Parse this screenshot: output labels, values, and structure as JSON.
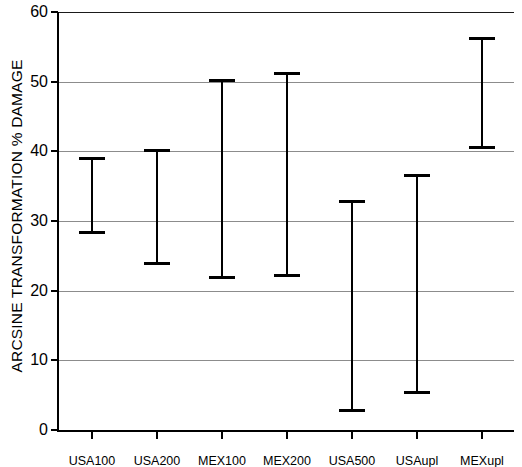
{
  "chart_data": {
    "type": "errorbar",
    "title": "",
    "xlabel": "",
    "ylabel": "ARCSINE TRANSFORMATION % DAMAGE",
    "ylim": [
      0,
      60
    ],
    "ytick_values": [
      0,
      10,
      20,
      30,
      40,
      50,
      60
    ],
    "ytick_labels": [
      "0",
      "10",
      "20",
      "30",
      "40",
      "50",
      "60"
    ],
    "grid": true,
    "grid_axis": "y",
    "legend": "none",
    "categories": [
      "USA100",
      "USA200",
      "MEX100",
      "MEX200",
      "USA500",
      "USAupl",
      "MEXupl"
    ],
    "series": [
      {
        "name": "range",
        "lower": [
          28.4,
          24.0,
          22.0,
          22.2,
          2.8,
          5.4,
          40.6
        ],
        "upper": [
          39.1,
          40.2,
          50.3,
          51.2,
          32.9,
          36.6,
          56.2
        ]
      }
    ],
    "points": [
      {
        "category": "USA100",
        "lower": 28.4,
        "upper": 39.1
      },
      {
        "category": "USA200",
        "lower": 24.0,
        "upper": 40.2
      },
      {
        "category": "MEX100",
        "lower": 22.0,
        "upper": 50.3
      },
      {
        "category": "MEX200",
        "lower": 22.2,
        "upper": 51.2
      },
      {
        "category": "USA500",
        "lower": 2.8,
        "upper": 32.9
      },
      {
        "category": "USAupl",
        "lower": 5.4,
        "upper": 36.6
      },
      {
        "category": "MEXupl",
        "lower": 40.6,
        "upper": 56.2
      }
    ],
    "colors": {
      "bar": "#000000",
      "axis": "#000000",
      "grid": "#8c8c8c",
      "background": "#ffffff"
    }
  }
}
